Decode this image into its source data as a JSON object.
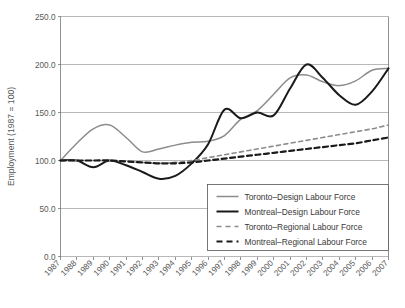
{
  "chart_data": {
    "type": "line",
    "title": "",
    "xlabel": "",
    "ylabel": "Employment (1987 = 100)",
    "ylim": [
      0,
      250
    ],
    "ytick_labels": [
      "0.0",
      "50.0",
      "100.0",
      "150.0",
      "200.0",
      "250.0"
    ],
    "ytick_values": [
      0,
      50,
      100,
      150,
      200,
      250
    ],
    "grid": true,
    "legend_position": "lower-right inside plot",
    "categories": [
      "1987",
      "1988",
      "1989",
      "1990",
      "1991",
      "1992",
      "1993",
      "1994",
      "1995",
      "1996",
      "1997",
      "1998",
      "1999",
      "2000",
      "2001",
      "2002",
      "2003",
      "2004",
      "2005",
      "2006",
      "2007"
    ],
    "series": [
      {
        "name": "Toronto–Design Labour Force",
        "style": "solid",
        "color": "#8c8c8c",
        "width": 1.5,
        "values": [
          100,
          118,
          133,
          137,
          124,
          109,
          112,
          116,
          119,
          120,
          126,
          143,
          152,
          169,
          186,
          189,
          182,
          178,
          183,
          194,
          196
        ]
      },
      {
        "name": "Montreal–Design Labour Force",
        "style": "solid",
        "color": "#1a1a1a",
        "width": 2.0,
        "values": [
          100,
          100,
          93,
          100,
          95,
          88,
          81,
          84,
          97,
          117,
          153,
          144,
          150,
          147,
          175,
          200,
          186,
          168,
          158,
          172,
          196
        ]
      },
      {
        "name": "Toronto–Regional Labour Force",
        "style": "dashed",
        "color": "#8c8c8c",
        "width": 1.6,
        "values": [
          100,
          100,
          100,
          100,
          99,
          98,
          97,
          98,
          100,
          103,
          106,
          109,
          112,
          115,
          118,
          121,
          124,
          127,
          130,
          133,
          137
        ]
      },
      {
        "name": "Montreal–Regional Labour Force",
        "style": "dashed",
        "color": "#1a1a1a",
        "width": 2.2,
        "values": [
          100,
          100,
          100,
          100,
          99,
          98,
          97,
          97,
          98,
          100,
          102,
          104,
          106,
          108,
          110,
          112,
          114,
          116,
          118,
          121,
          124
        ]
      }
    ]
  },
  "legend": {
    "items": [
      {
        "label": "Toronto–Design Labour Force"
      },
      {
        "label": "Montreal–Design Labour Force"
      },
      {
        "label": "Toronto–Regional Labour Force"
      },
      {
        "label": "Montreal–Regional Labour Force"
      }
    ]
  },
  "colors": {
    "toronto": "#8c8c8c",
    "montreal": "#1a1a1a",
    "grid": "#9a9a9a",
    "axis": "#777777",
    "text": "#585858",
    "background": "#ffffff"
  }
}
